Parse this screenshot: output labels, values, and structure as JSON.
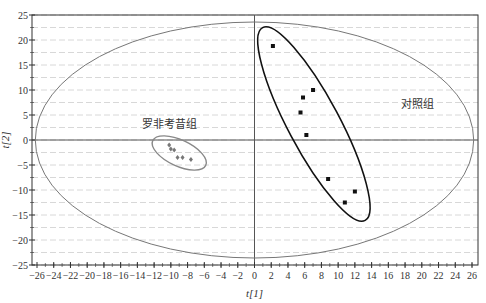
{
  "chart_data": {
    "type": "scatter",
    "title": "",
    "xlabel": "t[1]",
    "ylabel": "t[2]",
    "xlim": [
      -26,
      26
    ],
    "ylim": [
      -25,
      25
    ],
    "x_ticks": [
      -26,
      -24,
      -22,
      -20,
      -18,
      -16,
      -14,
      -12,
      -10,
      -8,
      -6,
      -4,
      -2,
      0,
      2,
      4,
      6,
      8,
      10,
      12,
      14,
      16,
      18,
      20,
      22,
      24,
      26
    ],
    "y_ticks": [
      25,
      20,
      15,
      10,
      5,
      0,
      -5,
      -10,
      -15,
      -20,
      -25
    ],
    "grid": "horizontal dashed",
    "hotelling_ellipse": {
      "cx": 0,
      "cy": 0,
      "rx": 26.2,
      "ry": 23.6
    },
    "series": [
      {
        "name": "对照组",
        "marker": "square",
        "color": "#111111",
        "points": [
          [
            2.2,
            18.8
          ],
          [
            7.0,
            10.0
          ],
          [
            5.8,
            8.5
          ],
          [
            5.5,
            5.5
          ],
          [
            6.2,
            1.0
          ],
          [
            8.8,
            -7.8
          ],
          [
            12.0,
            -10.3
          ],
          [
            10.8,
            -12.5
          ]
        ],
        "ellipse": {
          "cx": 7.1,
          "cy": 3.2,
          "rx": 19.5,
          "ry": 5.6,
          "angle_deg": 62,
          "color": "#111111"
        }
      },
      {
        "name": "罗非考昔组",
        "marker": "diamond",
        "color": "#777777",
        "points": [
          [
            -10.2,
            -1.0
          ],
          [
            -10.0,
            -1.8
          ],
          [
            -9.6,
            -2.0
          ],
          [
            -9.2,
            -3.5
          ],
          [
            -8.6,
            -3.5
          ],
          [
            -7.6,
            -3.9
          ]
        ],
        "ellipse": {
          "cx": -9.0,
          "cy": -2.6,
          "rx": 3.9,
          "ry": 2.1,
          "angle_deg": 25,
          "color": "#888888"
        }
      }
    ],
    "annotations": [
      {
        "text": "罗非考昔组",
        "x": -13.5,
        "y": 2.5
      },
      {
        "text": "对照组",
        "x": 17.5,
        "y": 6.5
      }
    ]
  }
}
